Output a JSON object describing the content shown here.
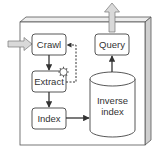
{
  "diagram": {
    "type": "search-engine-architecture",
    "nodes": [
      {
        "id": "crawl",
        "label": "Crawl"
      },
      {
        "id": "extract",
        "label": "Extract"
      },
      {
        "id": "index",
        "label": "Index"
      },
      {
        "id": "query",
        "label": "Query"
      },
      {
        "id": "inverse_index",
        "label_line1": "Inverse",
        "label_line2": "index"
      }
    ],
    "edges": [
      {
        "from": "input",
        "to": "crawl",
        "style": "block-arrow"
      },
      {
        "from": "crawl",
        "to": "extract",
        "style": "solid"
      },
      {
        "from": "extract",
        "to": "crawl",
        "style": "dashed"
      },
      {
        "from": "extract",
        "to": "index",
        "style": "solid"
      },
      {
        "from": "index",
        "to": "inverse_index",
        "style": "solid"
      },
      {
        "from": "inverse_index",
        "to": "query",
        "style": "solid"
      },
      {
        "from": "query",
        "to": "output",
        "style": "block-arrow"
      }
    ],
    "icons": {
      "extract_gear": "gear-icon"
    },
    "colors": {
      "stroke": "#333333",
      "box_fill": "#ffffff",
      "block_arrow_fill": "#d9d9d9",
      "side_face": "#cfcfcf",
      "top_face": "#ededed"
    }
  }
}
